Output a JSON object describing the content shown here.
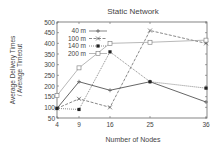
{
  "chart_data": {
    "type": "line",
    "title": "Static Network",
    "xlabel": "Number of Nodes",
    "ylabel": [
      "Average Delivery Times",
      "/ Average Timeout"
    ],
    "x": [
      4,
      9,
      16,
      25,
      36
    ],
    "xticks": [
      "4",
      "9",
      "16",
      "25",
      "36"
    ],
    "ylim": [
      50,
      500
    ],
    "yticks": [
      50,
      100,
      150,
      200,
      250,
      300,
      350,
      400,
      450,
      500
    ],
    "grid": false,
    "legend_position": "upper left (inside)",
    "series": [
      {
        "name": "40 m",
        "marker": "plus",
        "dash": "solid",
        "color": "#555555",
        "values": [
          95,
          220,
          180,
          220,
          125
        ]
      },
      {
        "name": "100 m",
        "marker": "cross",
        "dash": "dashed",
        "color": "#555555",
        "values": [
          95,
          140,
          100,
          460,
          400
        ]
      },
      {
        "name": "140 m",
        "marker": "filled-square",
        "dash": "dotted",
        "color": "#555555",
        "values": [
          95,
          90,
          360,
          220,
          190
        ]
      },
      {
        "name": "200 m",
        "marker": "open-square",
        "dash": "solid-light",
        "color": "#999999",
        "values": [
          155,
          285,
          400,
          405,
          415
        ]
      }
    ]
  }
}
